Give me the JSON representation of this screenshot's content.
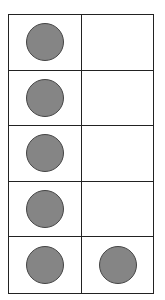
{
  "ten_frame": {
    "rows": 5,
    "columns": 2,
    "counter_color": "#858585",
    "cells": [
      {
        "row": 0,
        "col": 0,
        "filled": true
      },
      {
        "row": 0,
        "col": 1,
        "filled": false
      },
      {
        "row": 1,
        "col": 0,
        "filled": true
      },
      {
        "row": 1,
        "col": 1,
        "filled": false
      },
      {
        "row": 2,
        "col": 0,
        "filled": true
      },
      {
        "row": 2,
        "col": 1,
        "filled": false
      },
      {
        "row": 3,
        "col": 0,
        "filled": true
      },
      {
        "row": 3,
        "col": 1,
        "filled": false
      },
      {
        "row": 4,
        "col": 0,
        "filled": true
      },
      {
        "row": 4,
        "col": 1,
        "filled": true
      }
    ],
    "filled_count": 6
  }
}
